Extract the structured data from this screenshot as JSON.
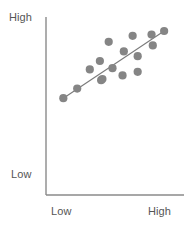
{
  "chart_data": {
    "type": "scatter",
    "title": "",
    "xlabel": "",
    "ylabel": "",
    "xtick_labels": [
      "Low",
      "High"
    ],
    "ytick_labels": [
      "Low",
      "High"
    ],
    "xlim": [
      0,
      100
    ],
    "ylim": [
      0,
      100
    ],
    "grid": false,
    "legend": null,
    "series": [
      {
        "name": "observations",
        "marker": "circle",
        "color": "#858585",
        "points": [
          {
            "x": 9,
            "y": 39
          },
          {
            "x": 20,
            "y": 47
          },
          {
            "x": 30,
            "y": 63
          },
          {
            "x": 38,
            "y": 70
          },
          {
            "x": 39,
            "y": 54
          },
          {
            "x": 40,
            "y": 55
          },
          {
            "x": 45,
            "y": 86
          },
          {
            "x": 48,
            "y": 64
          },
          {
            "x": 56,
            "y": 58
          },
          {
            "x": 57,
            "y": 78
          },
          {
            "x": 64,
            "y": 91
          },
          {
            "x": 68,
            "y": 74
          },
          {
            "x": 68,
            "y": 61
          },
          {
            "x": 79,
            "y": 92
          },
          {
            "x": 80,
            "y": 83
          },
          {
            "x": 89,
            "y": 95
          }
        ]
      }
    ],
    "trend_line": {
      "name": "trend",
      "color": "#7a7a7a",
      "start": {
        "x": 9,
        "y": 39
      },
      "end": {
        "x": 89,
        "y": 95
      }
    },
    "axes": {
      "origin_px": {
        "x": 46,
        "y": 195
      },
      "x_end_px": 184,
      "y_top_px": 17,
      "color": "#8a8a8a"
    }
  },
  "labels": {
    "y_high": "High",
    "y_low": "Low",
    "x_low": "Low",
    "x_high": "High"
  }
}
